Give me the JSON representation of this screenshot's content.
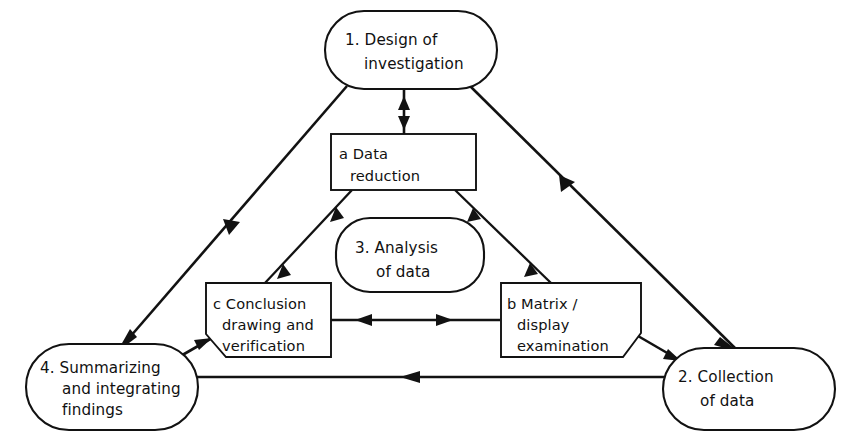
{
  "diagram": {
    "background_color": "#ffffff",
    "line_color": "#121212",
    "nodes": [
      {
        "id": "design",
        "name": "node-design-of-investigation",
        "shape": "stadium",
        "lines": [
          "1. Design of",
          "investigation"
        ]
      },
      {
        "id": "collection",
        "name": "node-collection-of-data",
        "shape": "stadium",
        "lines": [
          "2. Collection",
          "of data"
        ]
      },
      {
        "id": "analysis",
        "name": "node-analysis-of-data",
        "shape": "stadium",
        "lines": [
          "3. Analysis",
          "of data"
        ]
      },
      {
        "id": "summarizing",
        "name": "node-summarizing-and-integrating-findings",
        "shape": "stadium",
        "lines": [
          "4. Summarizing",
          "and integrating",
          "findings"
        ]
      },
      {
        "id": "data-reduction",
        "name": "node-data-reduction",
        "shape": "rectangle",
        "lines": [
          "a Data",
          "reduction"
        ]
      },
      {
        "id": "matrix-display",
        "name": "node-matrix-display-examination",
        "shape": "notched-rectangle-bottom-right",
        "lines": [
          "b Matrix /",
          "display",
          "examination"
        ]
      },
      {
        "id": "conclusion",
        "name": "node-conclusion-drawing-and-verification",
        "shape": "notched-rectangle-bottom-left",
        "lines": [
          "c Conclusion",
          "drawing and",
          "verification"
        ]
      }
    ],
    "edges": [
      {
        "id": "e1",
        "name": "edge-design-to-data-reduction",
        "from": "design",
        "to": "data-reduction",
        "direction": "both"
      },
      {
        "id": "e2",
        "name": "edge-design-to-summarizing",
        "from": "design",
        "to": "summarizing",
        "direction": "forward"
      },
      {
        "id": "e3",
        "name": "edge-design-to-collection",
        "from": "design",
        "to": "collection",
        "direction": "forward"
      },
      {
        "id": "e4",
        "name": "edge-conclusion-to-data-reduction",
        "from": "conclusion",
        "to": "data-reduction",
        "direction": "both"
      },
      {
        "id": "e5",
        "name": "edge-data-reduction-to-matrix-display",
        "from": "data-reduction",
        "to": "matrix-display",
        "direction": "both"
      },
      {
        "id": "e6",
        "name": "edge-conclusion-to-matrix-display",
        "from": "conclusion",
        "to": "matrix-display",
        "direction": "both"
      },
      {
        "id": "e7",
        "name": "edge-summarizing-to-conclusion",
        "from": "summarizing",
        "to": "conclusion",
        "direction": "forward"
      },
      {
        "id": "e8",
        "name": "edge-matrix-display-to-collection",
        "from": "matrix-display",
        "to": "collection",
        "direction": "forward"
      },
      {
        "id": "e9",
        "name": "edge-collection-to-summarizing",
        "from": "collection",
        "to": "summarizing",
        "direction": "forward"
      }
    ]
  }
}
